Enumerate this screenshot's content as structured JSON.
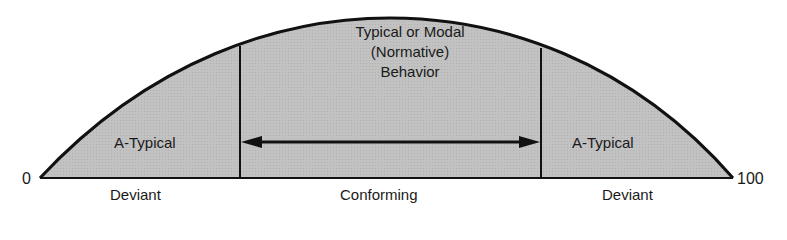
{
  "diagram": {
    "axis": {
      "min_label": "0",
      "max_label": "100"
    },
    "regions": [
      {
        "name": "left",
        "inner_label": "A-Typical",
        "bottom_label": "Deviant"
      },
      {
        "name": "center",
        "bottom_label": "Conforming",
        "title_lines": [
          "Typical or Modal",
          "(Normative)",
          "Behavior"
        ]
      },
      {
        "name": "right",
        "inner_label": "A-Typical",
        "bottom_label": "Deviant"
      }
    ],
    "colors": {
      "fill": "#bdbdbd",
      "stroke": "#111111",
      "text": "#1a1a1a"
    }
  }
}
